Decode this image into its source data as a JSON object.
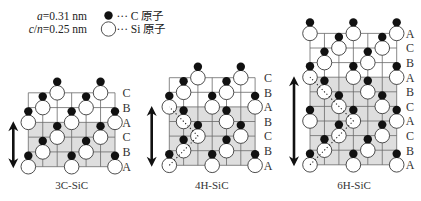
{
  "legend": {
    "lattice_a": {
      "symbol": "a",
      "value": "=0.31 nm"
    },
    "lattice_cn": {
      "symbol_c": "c",
      "slash": "/",
      "symbol_n": "n",
      "value": "=0.25 nm"
    },
    "carbon": {
      "label": "··· C 原子",
      "color": "#111111",
      "icon": "filled-circle"
    },
    "silicon": {
      "label": "··· Si 原子",
      "color": "#ffffff",
      "icon": "hollow-circle"
    }
  },
  "colors": {
    "unit_cell_shade": "#dedede",
    "arrow": "#111111"
  },
  "polytypes": [
    {
      "name": "3C-SiC",
      "stacking_top_to_bottom": [
        "C",
        "B",
        "A",
        "C",
        "B",
        "A"
      ],
      "unit_cell_layers": 3,
      "show_zigzag": false
    },
    {
      "name": "4H-SiC",
      "stacking_top_to_bottom": [
        "C",
        "B",
        "A",
        "B",
        "C",
        "B",
        "A"
      ],
      "unit_cell_layers": 4,
      "show_zigzag": true
    },
    {
      "name": "6H-SiC",
      "stacking_top_to_bottom": [
        "A",
        "C",
        "B",
        "A",
        "B",
        "C",
        "A",
        "C",
        "B",
        "A"
      ],
      "unit_cell_layers": 6,
      "show_zigzag": true
    }
  ]
}
